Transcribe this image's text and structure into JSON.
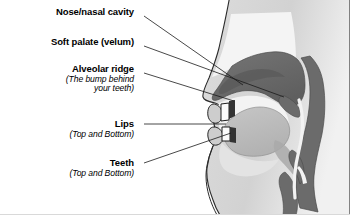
{
  "figure": {
    "kind": "anatomical-diagram",
    "background_color": "#ffffff",
    "bottom_border_color": "#d9d9d9"
  },
  "labels": [
    {
      "id": "nose-nasal-cavity",
      "title": "Nose/nasal cavity",
      "subtitle": [],
      "anchor_x": 134,
      "anchor_y": 13
    },
    {
      "id": "soft-palate-velum",
      "title": "Soft palate (velum)",
      "subtitle": [],
      "anchor_x": 134,
      "anchor_y": 43
    },
    {
      "id": "alveolar-ridge",
      "title": "Alveolar ridge",
      "subtitle": [
        "(The bump behind",
        "your teeth)"
      ],
      "anchor_x": 134,
      "anchor_y": 70
    },
    {
      "id": "lips",
      "title": "Lips",
      "subtitle": [
        "(Top and Bottom)"
      ],
      "anchor_x": 134,
      "anchor_y": 127
    },
    {
      "id": "teeth",
      "title": "Teeth",
      "subtitle": [
        "(Top and Bottom)"
      ],
      "anchor_x": 134,
      "anchor_y": 166
    }
  ],
  "leader_lines": [
    {
      "id": "leader-nose",
      "x1": 144,
      "y1": 16,
      "x2": 243,
      "y2": 85
    },
    {
      "id": "leader-soft-palate",
      "x1": 144,
      "y1": 46,
      "x2": 282,
      "y2": 96
    },
    {
      "id": "leader-alveolar-ridge",
      "x1": 144,
      "y1": 73,
      "x2": 235,
      "y2": 101
    },
    {
      "id": "leader-lips",
      "x1": 144,
      "y1": 124,
      "x2": 226,
      "y2": 124
    },
    {
      "id": "leader-teeth",
      "x1": 144,
      "y1": 163,
      "x2": 231,
      "y2": 134
    }
  ],
  "anatomy_regions": [
    {
      "id": "head-silhouette",
      "name": "head outline / skin",
      "color": "#d6d6d6"
    },
    {
      "id": "nasal-cavity",
      "name": "nasal cavity",
      "color": "#f2f2f2"
    },
    {
      "id": "hard-soft-palate",
      "name": "hard palate and velum",
      "color": "#6e6e6e"
    },
    {
      "id": "pharynx-wall",
      "name": "pharyngeal wall",
      "color": "#6e6e6e"
    },
    {
      "id": "tongue",
      "name": "tongue",
      "color": "#bdbdbd"
    },
    {
      "id": "oral-cavity",
      "name": "oral cavity air space",
      "color": "#f2f2f2"
    },
    {
      "id": "lips-region",
      "name": "lips (top and bottom)",
      "color": "#cfcfcf"
    },
    {
      "id": "teeth-region",
      "name": "teeth (top and bottom)",
      "color": "#ffffff"
    },
    {
      "id": "larynx-trachea",
      "name": "larynx and trachea",
      "color": "#6e6e6e"
    },
    {
      "id": "outline-stroke",
      "name": "diagram outline stroke",
      "color": "#1a1a1a"
    }
  ]
}
